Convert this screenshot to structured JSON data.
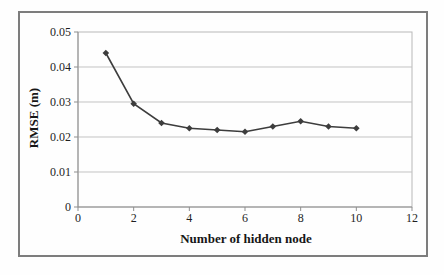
{
  "figure": {
    "border_color": "#7d7d7d",
    "background": "#fefefe"
  },
  "chart_data": {
    "type": "line",
    "title": "",
    "xlabel": "Number of hidden node",
    "ylabel": "RMSE (m)",
    "x": [
      1,
      2,
      3,
      4,
      5,
      6,
      7,
      8,
      9,
      10
    ],
    "y": [
      0.044,
      0.0295,
      0.024,
      0.0225,
      0.022,
      0.0215,
      0.023,
      0.0245,
      0.023,
      0.0225
    ],
    "xlim": [
      0,
      12
    ],
    "ylim": [
      0,
      0.05
    ],
    "x_tick_values": [
      0,
      2,
      4,
      6,
      8,
      10,
      12
    ],
    "x_tick_labels": [
      "0",
      "2",
      "4",
      "6",
      "8",
      "10",
      "12"
    ],
    "y_tick_values": [
      0,
      0.01,
      0.02,
      0.03,
      0.04,
      0.05
    ],
    "y_tick_labels": [
      "0",
      "0.01",
      "0.02",
      "0.03",
      "0.04",
      "0.05"
    ],
    "grid": "horizontal",
    "legend": "none",
    "marker": "diamond",
    "series_color": "#3d3d3d",
    "gridline_color": "#c3c3c3",
    "axis_color": "#8f8f8f",
    "plot_border_color": "#b8b8b8",
    "tick_color": "#8f8f8f"
  }
}
